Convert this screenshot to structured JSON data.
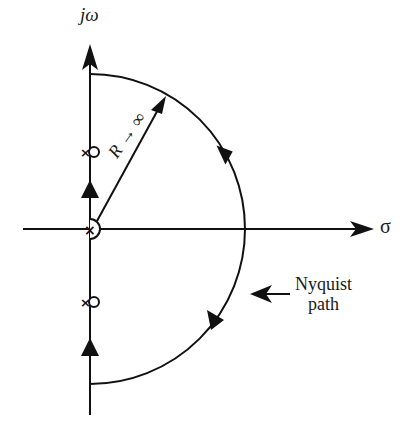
{
  "diagram": {
    "type": "nyquist-contour",
    "axes": {
      "vertical_label": "jω",
      "horizontal_label": "σ"
    },
    "radius_label": "R → ∞",
    "path_label_line1": "Nyquist",
    "path_label_line2": "path",
    "elements": {
      "origin_pole": "×",
      "upper_pole": "×",
      "lower_pole": "×",
      "path_direction": "clockwise",
      "indentation_at_origin": "small semicircle to the right",
      "indentations_at_jw_poles": "small circles"
    },
    "stroke_color": "#111111",
    "background": "#ffffff"
  }
}
